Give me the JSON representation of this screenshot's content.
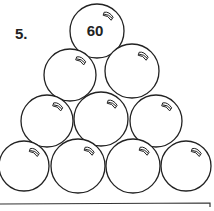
{
  "problem": {
    "number": "5.",
    "balls": [
      {
        "id": "r1c1",
        "cx": 97,
        "cy": 31,
        "r": 27,
        "label": "60"
      },
      {
        "id": "r2c1",
        "cx": 70,
        "cy": 75,
        "r": 26,
        "label": ""
      },
      {
        "id": "r2c2",
        "cx": 132,
        "cy": 71,
        "r": 27,
        "label": ""
      },
      {
        "id": "r3c1",
        "cx": 47,
        "cy": 121,
        "r": 26,
        "label": ""
      },
      {
        "id": "r3c2",
        "cx": 101,
        "cy": 119,
        "r": 27,
        "label": ""
      },
      {
        "id": "r3c3",
        "cx": 156,
        "cy": 121,
        "r": 26,
        "label": ""
      },
      {
        "id": "r4c1",
        "cx": 24,
        "cy": 166,
        "r": 25,
        "label": ""
      },
      {
        "id": "r4c2",
        "cx": 78,
        "cy": 166,
        "r": 27,
        "label": ""
      },
      {
        "id": "r4c3",
        "cx": 133,
        "cy": 166,
        "r": 27,
        "label": ""
      },
      {
        "id": "r4c4",
        "cx": 186,
        "cy": 166,
        "r": 25,
        "label": ""
      }
    ],
    "stroke_color": "#222222"
  }
}
